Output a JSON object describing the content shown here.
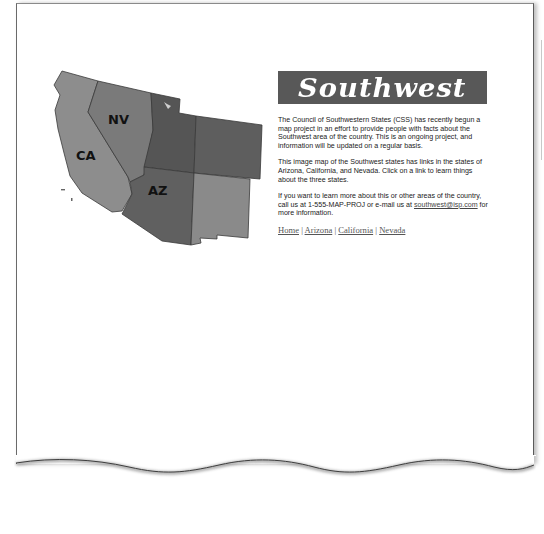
{
  "map": {
    "labels": {
      "nv": "NV",
      "ca": "CA",
      "az": "AZ"
    },
    "colors": {
      "ca": "#8d8d8d",
      "nv": "#7a7a7a",
      "ut": "#555555",
      "co": "#5e5e5e",
      "az": "#606060",
      "nm": "#8a8a8a",
      "border": "#3a3a3a"
    }
  },
  "banner": {
    "title": "Southwest",
    "background": "#585858"
  },
  "content": {
    "paragraph1": "The Council of Southwestern States (CSS) has recently begun a map project in an effort to provide people with facts about the Southwest area of the country. This is an ongoing project, and information will be updated on a regular basis.",
    "paragraph2": "This image map of the Southwest states has links in the states of Arizona, California, and Nevada. Click on a link to learn things about the three states.",
    "paragraph3_before": "If you want to learn more about this or other areas of the country, call us at 1-555-MAP-PROJ or e-mail us at ",
    "email_link": "southwest@isp.com",
    "paragraph3_after": " for more information."
  },
  "nav": {
    "separator": " | ",
    "links": [
      "Home",
      "Arizona",
      "California",
      "Nevada"
    ]
  }
}
